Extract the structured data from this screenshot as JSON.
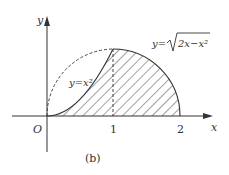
{
  "figure": {
    "caption": "(b)",
    "axes": {
      "x_label": "x",
      "y_label": "y",
      "origin_label": "O",
      "x_ticks": [
        "1",
        "2"
      ]
    },
    "curves": [
      {
        "name": "parabola",
        "label": "y=x²",
        "equation": "y = x^2",
        "style": "solid"
      },
      {
        "name": "semicircle",
        "label_prefix": "y=",
        "label_radicand": "2x−x²",
        "equation": "y = sqrt(2x - x^2)",
        "style": "solid right half, dashed left half"
      }
    ],
    "shaded_region": "area between y=x² (0≤x≤1) / semicircle (1≤x≤2) and x-axis, hatched",
    "dashed_line": "vertical line x=1 from x-axis to (1,1)"
  }
}
